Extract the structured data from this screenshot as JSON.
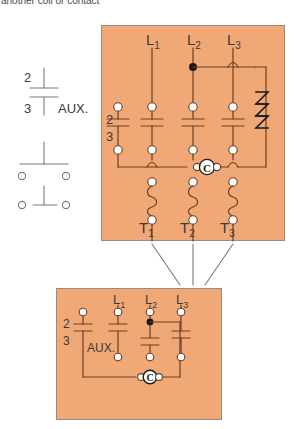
{
  "caption": {
    "text": "another coil or contact"
  },
  "colors": {
    "panel_fill": "#F0A877",
    "panel_border": "#9d8a7e",
    "wire": "#6b3f22",
    "symbol_line": "#7b7b7b",
    "terminal_fill": "#ffffff",
    "text": "#3a3a3a",
    "node": "#1a1a1a"
  },
  "aux_symbol": {
    "name": "auxiliary-contact-symbol",
    "terminal_top": "2",
    "terminal_bottom": "3",
    "label": "AUX.",
    "contacts": [
      {
        "type": "normally-closed-contact"
      },
      {
        "type": "normally-open-contact"
      }
    ]
  },
  "main_panel": {
    "name": "contactor-overload-panel",
    "line_labels": [
      "L",
      "L",
      "L"
    ],
    "line_subscripts": [
      "1",
      "2",
      "3"
    ],
    "load_labels": [
      "T",
      "T",
      "T"
    ],
    "load_subscripts": [
      "1",
      "2",
      "3"
    ],
    "aux_terminal_top": "2",
    "aux_terminal_bottom": "3",
    "coil_label": "C",
    "coil_winding": {
      "name": "contactor-coil-winding",
      "glyph": "Z",
      "segments": 3
    },
    "pole_count": 4,
    "heater_count": 3
  },
  "lower_panel": {
    "name": "control-circuit-panel",
    "line_labels": [
      "L",
      "L",
      "L"
    ],
    "line_subscripts": [
      "1",
      "2",
      "3"
    ],
    "aux_terminal_top": "2",
    "aux_terminal_bottom": "3",
    "aux_label": "AUX.",
    "coil_label": "C"
  },
  "connectors": {
    "name": "load-lead-lines",
    "count": 3
  }
}
